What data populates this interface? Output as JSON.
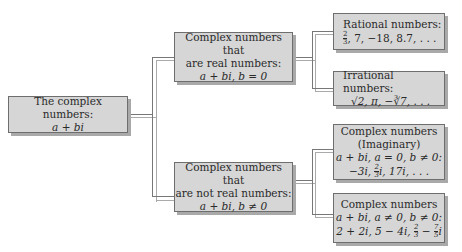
{
  "root": {
    "line1": "The complex numbers:",
    "line2": "a + bi"
  },
  "real": {
    "line1": "Complex numbers that",
    "line2": "are real numbers:",
    "line3": "a + bi, b = 0"
  },
  "not_real": {
    "line1": "Complex numbers that",
    "line2": "are not real numbers:",
    "line3": "a + bi, b ≠ 0"
  },
  "rational": {
    "title": "Rational numbers:",
    "frac_num": "2",
    "frac_den": "3",
    "examples": ", 7, −18, 8.7, . . ."
  },
  "irrational": {
    "title": "Irrational numbers:",
    "examples": "√2, π, −∛7, . . ."
  },
  "imaginary": {
    "line1": "Complex numbers",
    "line2": "(Imaginary)",
    "line3": "a + bi, a = 0, b ≠ 0:",
    "ex_a": "−3i, ",
    "frac_num": "2",
    "frac_den": "3",
    "ex_b": "i, 17i, . . ."
  },
  "complex": {
    "line1": "Complex numbers",
    "line2": "a + bi, a ≠ 0, b ≠ 0:",
    "ex_a": "2 + 2i, 5 − 4i, ",
    "frac1_num": "2",
    "frac1_den": "3",
    "ex_mid": " − ",
    "frac2_num": "7",
    "frac2_den": "5",
    "ex_b": "i"
  }
}
